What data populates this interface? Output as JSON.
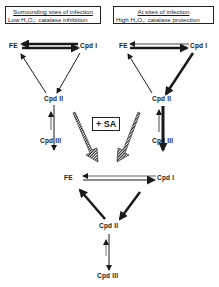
{
  "left_panel": {
    "title": "Surrounding sites of infection",
    "subtitle_prefix": "Low H",
    "subtitle_sub1": "2",
    "subtitle_mid": "O",
    "subtitle_sub2": "2",
    "subtitle_suffix": ": catalase inhibition",
    "nodes": {
      "fe": "FE",
      "cpd1": "Cpd  I",
      "cpd2": "Cpd  II",
      "cpd3": "Cpd  III"
    }
  },
  "right_panel": {
    "title": "At sites of infection",
    "subtitle_prefix": "High H",
    "subtitle_sub1": "2",
    "subtitle_mid": "O",
    "subtitle_sub2": "2",
    "subtitle_suffix": ": catalase protection",
    "nodes": {
      "fe": "FE",
      "cpd1": "Cpd  I",
      "cpd2": "Cpd  II",
      "cpd3": "Cpd  III"
    }
  },
  "treatment": {
    "label": "+ SA"
  },
  "bottom_panel": {
    "nodes": {
      "fe": "FE",
      "cpd1": "Cpd  I",
      "cpd2": "Cpd  II",
      "cpd3": "Cpd  III"
    }
  },
  "colors": {
    "ink": "#1a1a1a",
    "background": "#ffffff"
  }
}
